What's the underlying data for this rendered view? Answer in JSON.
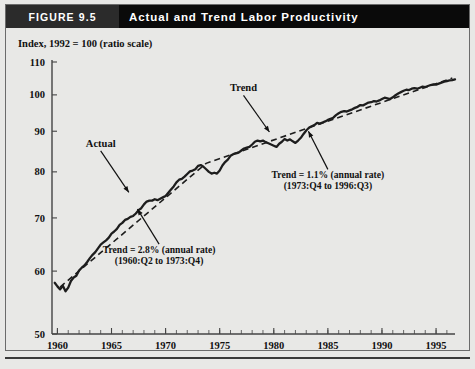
{
  "header": {
    "figure_tag": "FIGURE 9.5",
    "title": "Actual and Trend Labor Productivity"
  },
  "chart_data": {
    "type": "line",
    "title": "Actual and Trend Labor Productivity",
    "subtitle": "Index, 1992 = 100 (ratio scale)",
    "ylabel": "Index, 1992 = 100 (ratio scale)",
    "xlabel": "",
    "scale": "log",
    "grid": false,
    "legend": "inline-annotations",
    "xlim": [
      1959.5,
      1996.75
    ],
    "ylim": [
      50,
      110
    ],
    "yticks": [
      50,
      60,
      70,
      80,
      90,
      100,
      110
    ],
    "ytick_labels": [
      "50",
      "60",
      "70",
      "80",
      "90",
      "100",
      "110"
    ],
    "xticks": [
      1960,
      1965,
      1970,
      1975,
      1980,
      1985,
      1990,
      1995
    ],
    "xtick_labels": [
      "1960",
      "1965",
      "1970",
      "1975",
      "1980",
      "1985",
      "1990",
      "1995"
    ],
    "x_minor_interval": 1,
    "series": [
      {
        "name": "Actual",
        "style": "solid",
        "color": "#1d1d1d",
        "x": [
          1959.75,
          1960.0,
          1960.25,
          1960.5,
          1960.75,
          1961.0,
          1961.25,
          1961.5,
          1961.75,
          1962.0,
          1962.25,
          1962.5,
          1962.75,
          1963.0,
          1963.25,
          1963.5,
          1963.75,
          1964.0,
          1964.25,
          1964.5,
          1964.75,
          1965.0,
          1965.25,
          1965.5,
          1965.75,
          1966.0,
          1966.25,
          1966.5,
          1966.75,
          1967.0,
          1967.25,
          1967.5,
          1967.75,
          1968.0,
          1968.25,
          1968.5,
          1968.75,
          1969.0,
          1969.25,
          1969.5,
          1969.75,
          1970.0,
          1970.25,
          1970.5,
          1970.75,
          1971.0,
          1971.25,
          1971.5,
          1971.75,
          1972.0,
          1972.25,
          1972.5,
          1972.75,
          1973.0,
          1973.25,
          1973.5,
          1973.75,
          1974.0,
          1974.25,
          1974.5,
          1974.75,
          1975.0,
          1975.25,
          1975.5,
          1975.75,
          1976.0,
          1976.25,
          1976.5,
          1976.75,
          1977.0,
          1977.25,
          1977.5,
          1977.75,
          1978.0,
          1978.25,
          1978.5,
          1978.75,
          1979.0,
          1979.25,
          1979.5,
          1979.75,
          1980.0,
          1980.25,
          1980.5,
          1980.75,
          1981.0,
          1981.25,
          1981.5,
          1981.75,
          1982.0,
          1982.25,
          1982.5,
          1982.75,
          1983.0,
          1983.25,
          1983.5,
          1983.75,
          1984.0,
          1984.25,
          1984.5,
          1984.75,
          1985.0,
          1985.25,
          1985.5,
          1985.75,
          1986.0,
          1986.25,
          1986.5,
          1986.75,
          1987.0,
          1987.25,
          1987.5,
          1987.75,
          1988.0,
          1988.25,
          1988.5,
          1988.75,
          1989.0,
          1989.25,
          1989.5,
          1989.75,
          1990.0,
          1990.25,
          1990.5,
          1990.75,
          1991.0,
          1991.25,
          1991.5,
          1991.75,
          1992.0,
          1992.25,
          1992.5,
          1992.75,
          1993.0,
          1993.25,
          1993.5,
          1993.75,
          1994.0,
          1994.25,
          1994.5,
          1994.75,
          1995.0,
          1995.25,
          1995.5,
          1995.75,
          1996.0,
          1996.25,
          1996.5,
          1996.75
        ],
        "y": [
          58.0,
          57.4,
          56.9,
          57.5,
          56.6,
          57.2,
          58.3,
          58.9,
          59.2,
          60.1,
          60.6,
          61.0,
          61.6,
          62.3,
          62.9,
          63.4,
          64.1,
          64.8,
          65.2,
          65.6,
          66.1,
          66.9,
          67.3,
          67.8,
          68.6,
          69.0,
          69.6,
          69.8,
          70.2,
          70.4,
          70.9,
          71.6,
          72.0,
          72.8,
          73.4,
          73.6,
          73.6,
          73.9,
          73.7,
          74.0,
          74.3,
          74.6,
          75.3,
          76.0,
          76.7,
          77.6,
          78.2,
          78.4,
          78.9,
          79.5,
          80.1,
          80.3,
          80.6,
          81.4,
          81.6,
          81.2,
          80.6,
          80.0,
          79.6,
          79.8,
          79.6,
          80.3,
          81.5,
          82.3,
          82.9,
          83.8,
          84.2,
          84.4,
          84.6,
          85.1,
          85.6,
          85.8,
          86.0,
          86.6,
          87.3,
          87.6,
          87.4,
          87.6,
          87.2,
          86.9,
          86.6,
          86.3,
          86.0,
          86.8,
          87.3,
          88.0,
          87.6,
          87.9,
          87.4,
          87.0,
          87.6,
          88.3,
          89.3,
          90.2,
          90.9,
          91.3,
          91.6,
          92.2,
          92.0,
          92.3,
          92.6,
          93.0,
          93.3,
          93.6,
          94.3,
          94.8,
          95.2,
          95.4,
          95.3,
          95.6,
          95.9,
          96.3,
          96.6,
          97.1,
          97.0,
          97.4,
          97.8,
          97.9,
          98.2,
          98.1,
          98.4,
          98.8,
          99.2,
          99.0,
          98.8,
          99.3,
          99.9,
          100.4,
          100.8,
          101.2,
          101.5,
          101.4,
          101.8,
          102.0,
          101.8,
          102.1,
          102.4,
          102.3,
          102.6,
          102.9,
          103.1,
          103.0,
          103.3,
          103.6,
          103.9,
          104.1,
          104.3,
          104.4,
          104.6
        ]
      },
      {
        "name": "Trend",
        "style": "dashed",
        "color": "#1d1d1d",
        "x": [
          1960.25,
          1973.75,
          1996.5
        ],
        "y": [
          57.3,
          82.0,
          105.0
        ]
      }
    ],
    "annotations": [
      {
        "name": "actual-label",
        "text": "Actual",
        "x": 1964.0,
        "y": 86.0,
        "leader_to_x": 1966.6,
        "leader_to_y": 75.4
      },
      {
        "name": "trend-label",
        "text": "Trend",
        "x": 1977.2,
        "y": 101.0,
        "leader_to_x": 1979.6,
        "leader_to_y": 89.8
      },
      {
        "name": "trend-early-note",
        "line1": "Trend = 2.8% (annual rate)",
        "line2": "(1960:Q2 to 1973:Q4)",
        "x": 1969.4,
        "y": 63.2,
        "leader_to_x": 1967.4,
        "leader_to_y": 71.8
      },
      {
        "name": "trend-late-note",
        "line1": "Trend = 1.1% (annual rate)",
        "line2": "(1973:Q4 to 1996:Q3)",
        "x": 1985.0,
        "y": 78.5,
        "leader_to_x": 1983.2,
        "leader_to_y": 90.0
      }
    ]
  }
}
